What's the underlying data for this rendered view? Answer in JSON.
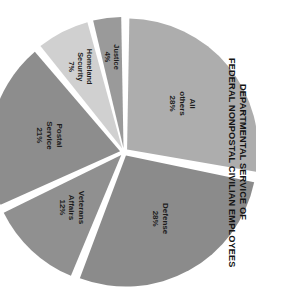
{
  "chart_data": {
    "type": "pie",
    "title": "DEPARTMENTAL SERVICE OF FEDERAL NONPOSTAL CIVILIAN EMPLOYEES",
    "title_lines": [
      "DEPARTMENTAL SERVICE OF",
      "FEDERAL NONPOSTAL CIVILIAN EMPLOYEES"
    ],
    "xlabel": "",
    "ylabel": "",
    "units": "percent",
    "legend": "none",
    "grid": false,
    "rotation_deg": 90,
    "categories": [
      "All others",
      "Defense",
      "Veterans Affairs",
      "Postal Service",
      "Homeland Security",
      "Justice"
    ],
    "values": [
      28,
      28,
      12,
      21,
      7,
      4
    ],
    "value_labels": [
      "28%",
      "28%",
      "12%",
      "21%",
      "7%",
      "4%"
    ],
    "colors": [
      "#adadad",
      "#8b8b8b",
      "#909090",
      "#8d8d8d",
      "#d0d0d0",
      "#9a9a9a"
    ],
    "slices": [
      {
        "label": "All others",
        "value": 28,
        "value_label": "28%",
        "color": "#adadad"
      },
      {
        "label": "Defense",
        "value": 28,
        "value_label": "28%",
        "color": "#8b8b8b"
      },
      {
        "label": "Veterans Affairs",
        "value": 12,
        "value_label": "12%",
        "color": "#909090"
      },
      {
        "label": "Postal Service",
        "value": 21,
        "value_label": "21%",
        "color": "#8d8d8d"
      },
      {
        "label": "Homeland Security",
        "value": 7,
        "value_label": "7%",
        "color": "#d0d0d0"
      },
      {
        "label": "Justice",
        "value": 4,
        "value_label": "4%",
        "color": "#9a9a9a"
      }
    ],
    "total": 100,
    "background": "#ffffff",
    "separator_color": "#ffffff",
    "label_color": "#1c1c1c"
  }
}
